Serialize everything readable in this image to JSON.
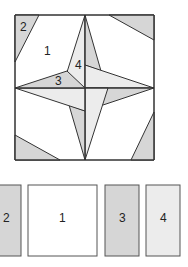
{
  "figure": {
    "type": "quilt-block-pattern",
    "block_labels": [
      {
        "id": "label-2",
        "text": "2"
      },
      {
        "id": "label-1",
        "text": "1"
      },
      {
        "id": "label-3",
        "text": "3"
      },
      {
        "id": "label-4",
        "text": "4"
      }
    ],
    "pieces": [
      {
        "id": "piece-2",
        "label": "2",
        "shade": "medium"
      },
      {
        "id": "piece-1",
        "label": "1",
        "shade": "white"
      },
      {
        "id": "piece-3",
        "label": "3",
        "shade": "medium"
      },
      {
        "id": "piece-4",
        "label": "4",
        "shade": "light"
      }
    ],
    "colors": {
      "stroke": "#333333",
      "white": "#ffffff",
      "medium": "#d6d6d6",
      "light": "#ececec"
    }
  }
}
